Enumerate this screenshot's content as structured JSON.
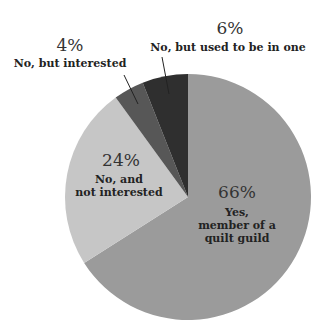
{
  "chart_data": {
    "type": "pie",
    "title": "",
    "start_angle_deg": 0,
    "direction": "clockwise",
    "slices": [
      {
        "label": "Yes, member of a quilt guild",
        "label_lines": [
          "Yes,",
          "member of a",
          "quilt guild"
        ],
        "value": 66,
        "pct_text": "66%",
        "color": "#9b9b9b"
      },
      {
        "label": "No, and not interested",
        "label_lines": [
          "No, and",
          "not interested"
        ],
        "value": 24,
        "pct_text": "24%",
        "color": "#c6c6c6"
      },
      {
        "label": "No, but interested",
        "label_lines": [
          "No, but interested"
        ],
        "value": 4,
        "pct_text": "4%",
        "color": "#575757"
      },
      {
        "label": "No, but used to be in one",
        "label_lines": [
          "No, but used to be in one"
        ],
        "value": 6,
        "pct_text": "6%",
        "color": "#2f2f2f"
      }
    ],
    "legend": "none",
    "units": "%"
  }
}
